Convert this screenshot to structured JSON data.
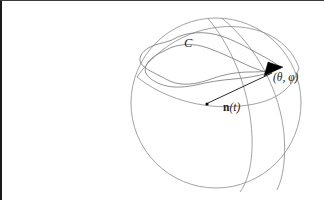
{
  "figure": {
    "kind": "sphere-diagram",
    "width": 324,
    "height": 200,
    "background_color": "#ffffff",
    "border_color": "#1a1a1a",
    "line_color": "#8a8a8a",
    "accent_color": "#000000"
  },
  "labels": {
    "curve": "C",
    "vector_n": "n",
    "vector_n_arg": "(t)",
    "vector_full": "n(t)",
    "point_angles": "(θ, φ)",
    "theta": "θ",
    "phi": "φ"
  },
  "geometry": {
    "sphere": {
      "center_x": 216,
      "center_y": 103,
      "radius": 85
    },
    "origin_dot": {
      "x": 207,
      "y": 104,
      "r": 1.6
    },
    "vector_tip": {
      "x": 281,
      "y": 69
    },
    "label_positions": {
      "curve_x": 184,
      "curve_y": 47,
      "vector_x": 223,
      "vector_y": 111,
      "angles_x": 273,
      "angles_y": 81
    }
  }
}
